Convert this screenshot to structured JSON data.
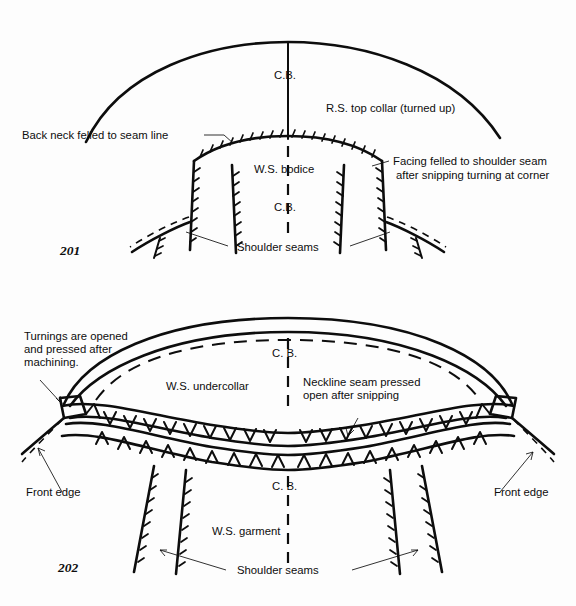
{
  "page": {
    "background_color": "#fdfdfd",
    "ink_color": "#0d0d0d"
  },
  "figures": [
    {
      "number": "201",
      "caption_labels": {
        "cb_collar": "C.B.",
        "cb_bodice": "C.B.",
        "top_collar": "R.S. top collar (turned up)",
        "back_neck": "Back neck felled to seam line",
        "bodice": "W.S. bodice",
        "facing_line1": "Facing felled to shoulder seam",
        "facing_line2": "after snipping turning at corner",
        "shoulder_seams": "Shoulder seams"
      }
    },
    {
      "number": "202",
      "caption_labels": {
        "turnings_line1": "Turnings are opened",
        "turnings_line2": "and pressed after",
        "turnings_line3": "machining.",
        "cb_collar": "C. B.",
        "cb_garment": "C. B.",
        "undercollar": "W.S. undercollar",
        "neckline_line1": "Neckline seam pressed",
        "neckline_line2": "open after snipping",
        "front_edge_left": "Front edge",
        "front_edge_right": "Front edge",
        "garment": "W.S. garment",
        "shoulder_seams": "Shoulder seams"
      }
    }
  ]
}
